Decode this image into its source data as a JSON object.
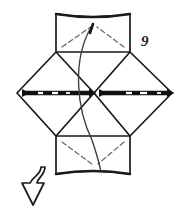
{
  "figure": {
    "step_number": "9",
    "caption": "",
    "kind": "origami-fold-diagram",
    "background_color": "#ffffff",
    "ink_color": "#1a1a1a",
    "crease_color": "#5a5a5a",
    "band_color": "#111111",
    "width": 187,
    "height": 212,
    "icons": {
      "left_diamond_band": "double-arrow-band-icon",
      "right_diamond_band": "double-arrow-band-icon",
      "bottom_arrow": "curved-down-arrow-icon",
      "center_curve": "fold-path-curve-icon"
    },
    "geometry": {
      "top_rect": {
        "x1": 56,
        "y1": 14,
        "x2": 130,
        "y2": 52,
        "top_bow_depth": 4,
        "diagonals": [
          {
            "x1": 62,
            "y1": 46,
            "x2": 92,
            "y2": 26
          },
          {
            "x1": 124,
            "y1": 46,
            "x2": 96,
            "y2": 26
          }
        ]
      },
      "bottom_rect": {
        "x1": 56,
        "y1": 136,
        "x2": 130,
        "y2": 174,
        "bottom_bow_depth": 4,
        "diagonals": [
          {
            "x1": 62,
            "y1": 142,
            "x2": 92,
            "y2": 164
          },
          {
            "x1": 124,
            "y1": 142,
            "x2": 96,
            "y2": 164
          }
        ]
      },
      "left_diamond": {
        "left": [
          17,
          93
        ],
        "top": [
          56,
          52
        ],
        "right": [
          94,
          93
        ],
        "bottom": [
          56,
          136
        ]
      },
      "right_diamond": {
        "left": [
          94,
          93
        ],
        "top": [
          130,
          52
        ],
        "right": [
          172,
          93
        ],
        "bottom": [
          130,
          136
        ]
      },
      "center_curve": {
        "start": [
          93,
          24
        ],
        "end": [
          101,
          172
        ],
        "c1": [
          70,
          60
        ],
        "c2": [
          116,
          128
        ]
      },
      "bottom_arrow": {
        "tail_start": [
          40,
          168
        ],
        "head_tip": [
          31,
          204
        ],
        "head_width": 26
      }
    },
    "labels": {
      "step": "9"
    }
  }
}
